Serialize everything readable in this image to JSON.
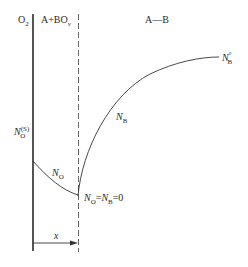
{
  "diagram": {
    "type": "oxidation-concentration-profile",
    "regions": {
      "gas": {
        "base": "O",
        "sub": "2"
      },
      "scale": {
        "base": "A+BO",
        "sub": "ν"
      },
      "alloy": {
        "text": "A—B"
      }
    },
    "labels": {
      "surface_conc": {
        "base": "N",
        "sub": "O",
        "sup": "(S)"
      },
      "bulk_conc": {
        "base": "N",
        "sub": "B",
        "sup": "°"
      },
      "n_b": {
        "base": "N",
        "sub": "B"
      },
      "n_o": {
        "base": "N",
        "sub": "O"
      },
      "front_eq": {
        "n1": "N",
        "s1": "O",
        "eq1": "=",
        "n2": "N",
        "s2": "B",
        "eq2": "=0"
      },
      "depth": {
        "text": "x"
      }
    },
    "colors": {
      "line": "#2a2a2a",
      "background": "#ffffff"
    }
  }
}
